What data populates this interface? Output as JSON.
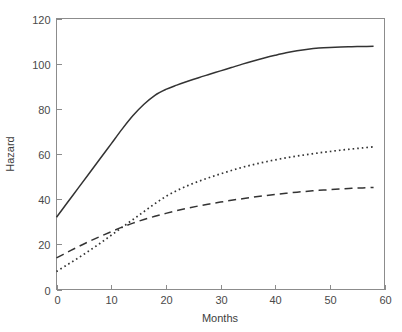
{
  "chart_data": {
    "type": "line",
    "title": "",
    "xlabel": "Months",
    "ylabel": "Hazard",
    "xlim": [
      0,
      60
    ],
    "ylim": [
      0,
      120
    ],
    "xticks": [
      0,
      10,
      20,
      30,
      40,
      50,
      60
    ],
    "yticks": [
      0,
      20,
      40,
      60,
      80,
      100,
      120
    ],
    "xticklabels": [
      "0",
      "10",
      "20",
      "30",
      "40",
      "50",
      "60"
    ],
    "yticklabels": [
      "0",
      "20",
      "40",
      "60",
      "80",
      "100",
      "120"
    ],
    "grid": false,
    "legend": null,
    "legend_position": "none",
    "background_color": "#ffffff",
    "line_color": "#333333",
    "axis_color": "#8c8c8c",
    "x": [
      0,
      2,
      4,
      6,
      8,
      10,
      12,
      14,
      16,
      18,
      20,
      22,
      24,
      26,
      28,
      30,
      32,
      34,
      36,
      38,
      40,
      42,
      44,
      46,
      48,
      50,
      52,
      54,
      56,
      58
    ],
    "series": [
      {
        "name": "solid-curve",
        "style": "solid",
        "values": [
          32.0,
          38.5,
          45.0,
          51.5,
          58.0,
          64.5,
          71.0,
          77.0,
          82.0,
          86.0,
          88.6,
          90.5,
          92.2,
          93.8,
          95.3,
          96.8,
          98.3,
          99.8,
          101.2,
          102.5,
          103.7,
          104.8,
          105.7,
          106.4,
          106.9,
          107.2,
          107.4,
          107.5,
          107.6,
          107.7
        ]
      },
      {
        "name": "dotted-curve",
        "style": "dotted",
        "values": [
          8.0,
          11.0,
          14.0,
          17.2,
          20.5,
          24.0,
          27.5,
          31.0,
          34.5,
          38.0,
          41.2,
          43.8,
          46.0,
          47.9,
          49.6,
          51.2,
          52.7,
          54.1,
          55.3,
          56.4,
          57.4,
          58.3,
          59.1,
          59.8,
          60.5,
          61.1,
          61.7,
          62.2,
          62.7,
          63.2
        ]
      },
      {
        "name": "dashed-curve",
        "style": "dashed",
        "values": [
          14.0,
          16.5,
          19.0,
          21.3,
          23.5,
          25.6,
          27.6,
          29.4,
          31.0,
          32.4,
          33.7,
          34.9,
          36.0,
          37.0,
          37.9,
          38.7,
          39.5,
          40.2,
          40.9,
          41.5,
          42.1,
          42.6,
          43.1,
          43.5,
          43.9,
          44.2,
          44.5,
          44.8,
          45.0,
          45.2
        ]
      }
    ]
  }
}
